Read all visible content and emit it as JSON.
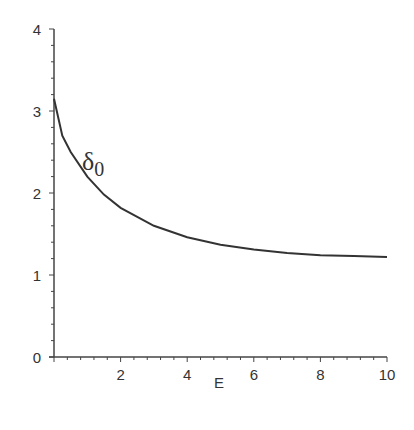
{
  "chart_data": {
    "type": "line",
    "title": "",
    "xlabel": "E",
    "ylabel": "",
    "xlim": [
      0,
      10
    ],
    "ylim": [
      0,
      4
    ],
    "x_ticks": [
      "2",
      "4",
      "6",
      "8",
      "10"
    ],
    "y_ticks": [
      "0",
      "1",
      "2",
      "3",
      "4"
    ],
    "grid": false,
    "legend": null,
    "annotations": [
      {
        "text": "δ",
        "subscript": "0",
        "x": 1.0,
        "y": 2.9
      }
    ],
    "series": [
      {
        "name": "δ0",
        "x": [
          0.0,
          0.25,
          0.5,
          1.0,
          1.5,
          2.0,
          3.0,
          4.0,
          5.0,
          6.0,
          7.0,
          8.0,
          9.0,
          10.0
        ],
        "values": [
          3.15,
          2.7,
          2.5,
          2.2,
          1.98,
          1.82,
          1.6,
          1.46,
          1.37,
          1.31,
          1.27,
          1.24,
          1.23,
          1.22
        ]
      }
    ]
  }
}
